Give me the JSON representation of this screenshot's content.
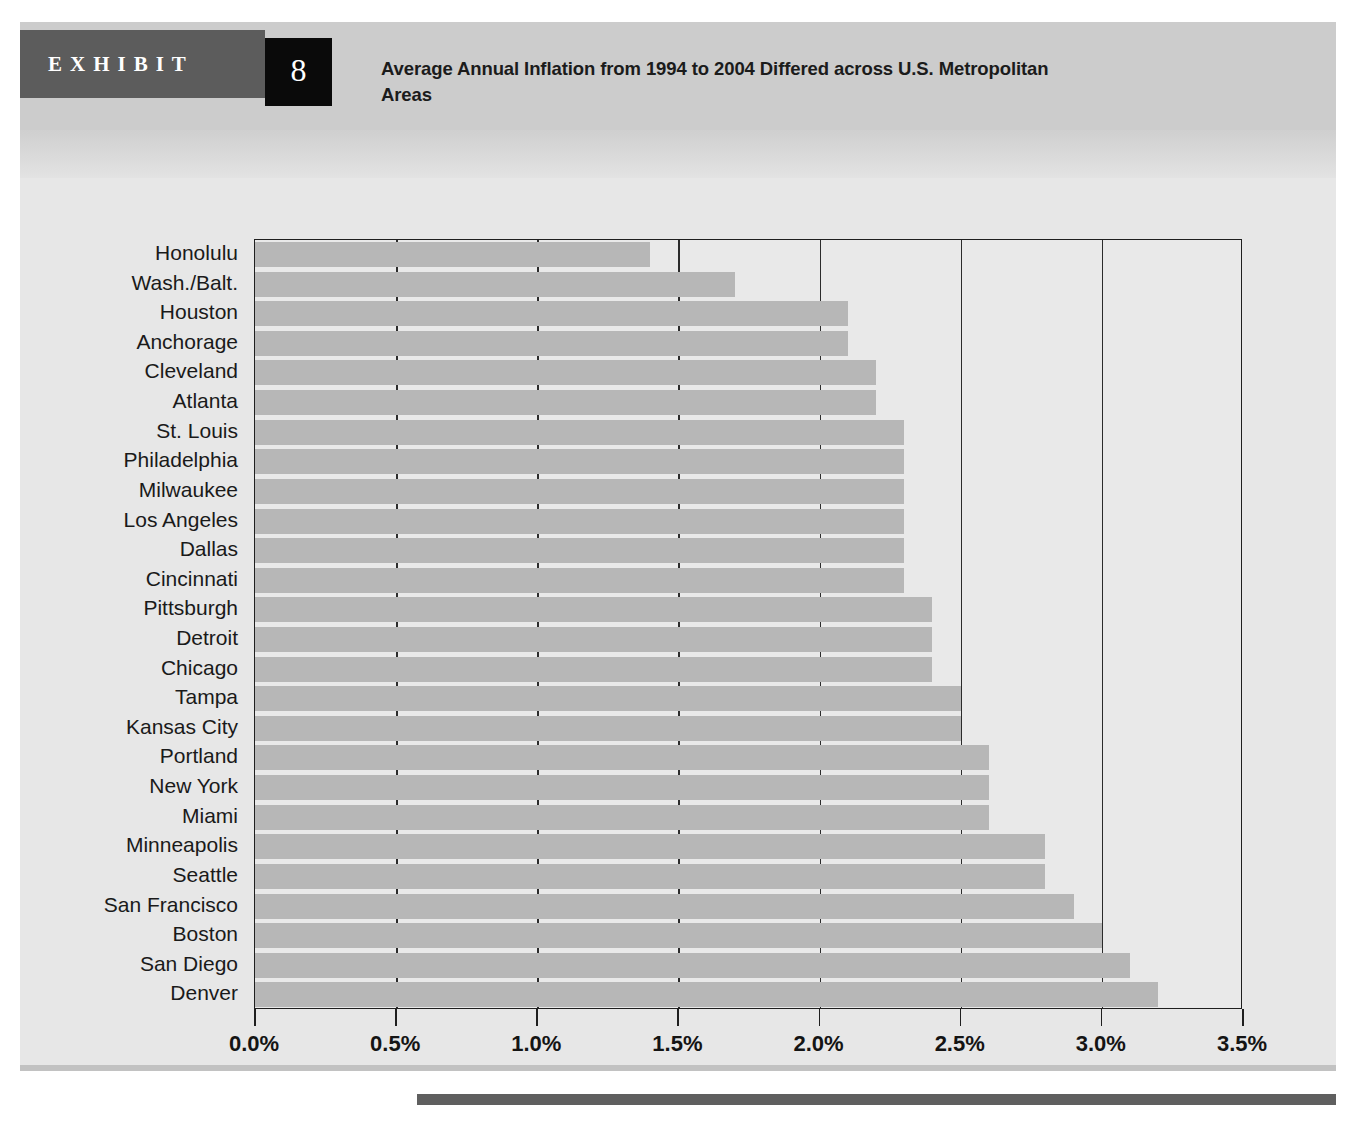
{
  "exhibit": {
    "tab_label": "EXHIBIT",
    "number": "8",
    "title": "Average Annual Inflation from 1994 to 2004 Differed across U.S. Metropolitan Areas"
  },
  "colors": {
    "bar": "#b7b7b7",
    "header_band": "#cccccc",
    "tab": "#5c5c5c",
    "number_box": "#0a0a0a",
    "plot_background": "#e9e9e9",
    "axis": "#1f1f1f",
    "rule": "#5f5f5f"
  },
  "chart_data": {
    "type": "bar",
    "orientation": "horizontal",
    "title": "Average Annual Inflation from 1994 to 2004 Differed across U.S. Metropolitan Areas",
    "xlabel": "",
    "ylabel": "",
    "xlim": [
      0.0,
      3.5
    ],
    "xtick_labels": [
      "0.0%",
      "0.5%",
      "1.0%",
      "1.5%",
      "2.0%",
      "2.5%",
      "3.0%",
      "3.5%"
    ],
    "xticks": [
      0.0,
      0.5,
      1.0,
      1.5,
      2.0,
      2.5,
      3.0,
      3.5
    ],
    "grid": "vertical",
    "legend": "none",
    "categories": [
      "Honolulu",
      "Wash./Balt.",
      "Houston",
      "Anchorage",
      "Cleveland",
      "Atlanta",
      "St. Louis",
      "Philadelphia",
      "Milwaukee",
      "Los Angeles",
      "Dallas",
      "Cincinnati",
      "Pittsburgh",
      "Detroit",
      "Chicago",
      "Tampa",
      "Kansas City",
      "Portland",
      "New York",
      "Miami",
      "Minneapolis",
      "Seattle",
      "San Francisco",
      "Boston",
      "San Diego",
      "Denver"
    ],
    "values": [
      1.4,
      1.7,
      2.1,
      2.1,
      2.2,
      2.2,
      2.3,
      2.3,
      2.3,
      2.3,
      2.3,
      2.3,
      2.4,
      2.4,
      2.4,
      2.5,
      2.5,
      2.6,
      2.6,
      2.6,
      2.8,
      2.8,
      2.9,
      3.0,
      3.1,
      3.2
    ],
    "units": "percent"
  }
}
